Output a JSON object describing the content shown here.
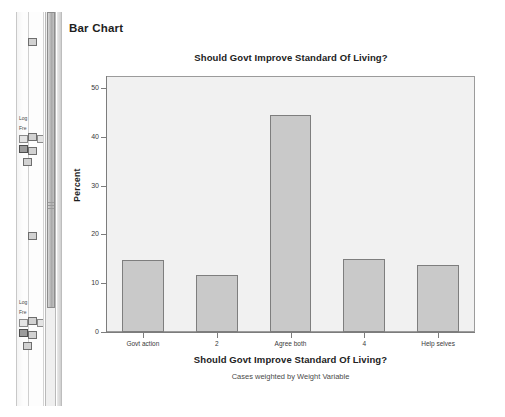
{
  "app": {
    "navigator": {
      "name": "output-navigator-pane",
      "tree_labels": [
        "Log",
        "Fre",
        "Log",
        "Fre"
      ],
      "icons": [
        "output-node-icon",
        "log-node-icon",
        "frequencies-node-icon",
        "table-node-icon",
        "chart-node-icon"
      ]
    },
    "scrollbar": {
      "name": "vertical-scrollbar"
    }
  },
  "output": {
    "heading": "Bar Chart"
  },
  "chart_data": {
    "type": "bar",
    "title": "Should Govt Improve Standard Of Living?",
    "xlabel": "Should Govt Improve Standard Of Living?",
    "ylabel": "Percent",
    "footnote": "Cases weighted by Weight Variable",
    "categories": [
      "Govt action",
      "2",
      "Agree both",
      "4",
      "Help selves"
    ],
    "values": [
      14.8,
      11.6,
      44.6,
      15.0,
      13.8
    ],
    "ylim": [
      0,
      52.5
    ],
    "yticks": [
      0,
      10,
      20,
      30,
      40,
      50
    ],
    "ytick_labels": [
      "0",
      "10",
      "20",
      "30",
      "40",
      "50"
    ],
    "grid": false,
    "legend": null,
    "bar_fill": "#c9c9c9",
    "bar_border": "#7e7e7e",
    "plot_background": "#f1f1f1"
  }
}
